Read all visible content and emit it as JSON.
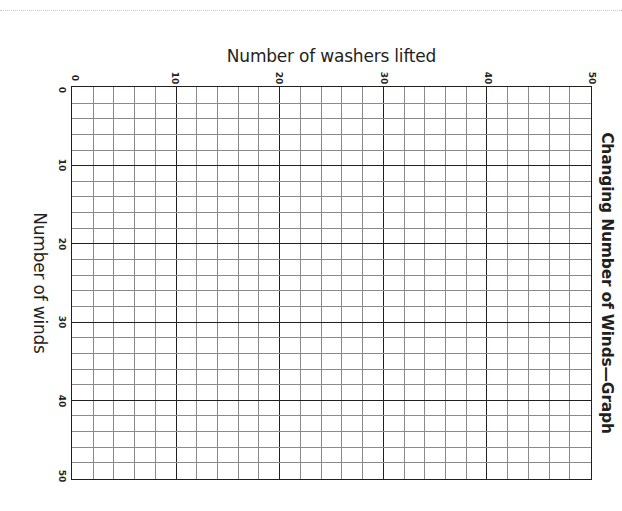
{
  "chart_data": {
    "type": "scatter",
    "title": "Changing Number of Winds—Graph",
    "xlabel": "Number of washers lifted",
    "ylabel": "Number of winds",
    "x_ticks": [
      "0",
      "10",
      "20",
      "30",
      "40",
      "50"
    ],
    "y_ticks": [
      "0",
      "10",
      "20",
      "30",
      "40",
      "50"
    ],
    "xlim": [
      0,
      50
    ],
    "ylim": [
      0,
      50
    ],
    "grid": true,
    "minor_step": 2,
    "major_step": 10,
    "series": [],
    "orientation": "rotated 90 degrees clockwise (blank worksheet graph)"
  },
  "page": {
    "title": "Changing Number of Winds—Graph",
    "xlabel": "Number of washers lifted",
    "ylabel": "Number of winds"
  },
  "colors": {
    "ink": "#231f20",
    "minor_grid": "#8a8a8a",
    "background": "#ffffff"
  }
}
